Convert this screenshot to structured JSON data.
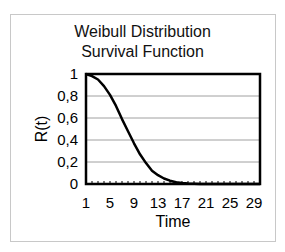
{
  "chart_data": {
    "type": "line",
    "title": "Weibull Distribution Survival Function",
    "title_lines": [
      "Weibull Distribution",
      "Survival Function"
    ],
    "xlabel": "Time",
    "ylabel": "R(t)",
    "x_tick_labels": [
      "1",
      "5",
      "9",
      "13",
      "17",
      "21",
      "25",
      "29"
    ],
    "y_tick_labels": [
      "0",
      "0,2",
      "0,4",
      "0,6",
      "0,8",
      "1"
    ],
    "xlim": [
      1,
      30
    ],
    "ylim": [
      0,
      1
    ],
    "grid": "horizontal",
    "legend": "none",
    "series": [
      {
        "name": "R(t)",
        "color": "#000000",
        "x": [
          1,
          2,
          3,
          4,
          5,
          6,
          7,
          8,
          9,
          10,
          11,
          12,
          13,
          14,
          15,
          16,
          17,
          18,
          19,
          20,
          21,
          22,
          23,
          24,
          25,
          26,
          27,
          28,
          29,
          30
        ],
        "values": [
          1.0,
          0.98,
          0.95,
          0.89,
          0.81,
          0.71,
          0.59,
          0.48,
          0.37,
          0.27,
          0.19,
          0.12,
          0.08,
          0.05,
          0.03,
          0.015,
          0.008,
          0.004,
          0.002,
          0.001,
          0,
          0,
          0,
          0,
          0,
          0,
          0,
          0,
          0,
          0
        ]
      }
    ]
  }
}
